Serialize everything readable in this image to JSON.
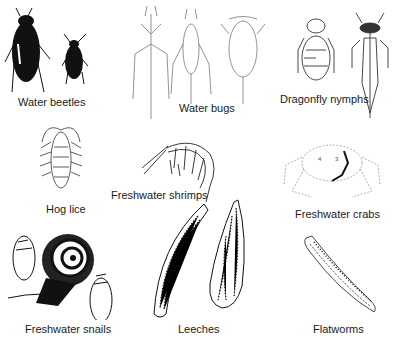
{
  "figure": {
    "organisms": [
      {
        "id": "water-beetles",
        "label": "Water beetles"
      },
      {
        "id": "water-bugs",
        "label": "Water bugs"
      },
      {
        "id": "dragonfly-nymphs",
        "label": "Dragonfly nymphs"
      },
      {
        "id": "hog-lice",
        "label": "Hog lice"
      },
      {
        "id": "freshwater-shrimps",
        "label": "Freshwater shrimps"
      },
      {
        "id": "freshwater-crabs",
        "label": "Freshwater crabs"
      },
      {
        "id": "freshwater-snails",
        "label": "Freshwater snails"
      },
      {
        "id": "leeches",
        "label": "Leeches"
      },
      {
        "id": "flatworms",
        "label": "Flatworms"
      }
    ],
    "crab_annotations": [
      "4",
      "3"
    ]
  }
}
